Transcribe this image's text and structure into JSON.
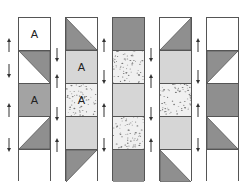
{
  "diagram": {
    "colors": {
      "white": "#ffffff",
      "dark": "#8f8f8f",
      "medium": "#a3a3a3",
      "light": "#d6d6d6",
      "speckled_bg": "#f0f0f0",
      "speckle": "#7a7a7a",
      "border": "#555555"
    },
    "columns": [
      {
        "x": 18,
        "squares": [
          {
            "type": "solid",
            "fill": "white",
            "label": "A"
          },
          {
            "type": "hst",
            "dark": "top-right",
            "light_fill": "white"
          },
          {
            "type": "solid",
            "fill": "medium",
            "label": "A"
          },
          {
            "type": "hst",
            "dark": "bottom-right",
            "light_fill": "white"
          },
          {
            "type": "solid",
            "fill": "white",
            "label": ""
          }
        ],
        "arrows": [
          {
            "y": 38,
            "dir": "up",
            "x": 9
          },
          {
            "y": 64,
            "dir": "down",
            "x": 9
          },
          {
            "y": 103,
            "dir": "up",
            "x": 9
          },
          {
            "y": 138,
            "dir": "down",
            "x": 9
          }
        ]
      },
      {
        "x": 65,
        "squares": [
          {
            "type": "hst",
            "dark": "bottom-left",
            "light_fill": "white"
          },
          {
            "type": "solid",
            "fill": "light",
            "label": "A"
          },
          {
            "type": "speckled",
            "label": "A"
          },
          {
            "type": "solid",
            "fill": "light",
            "label": ""
          },
          {
            "type": "hst",
            "dark": "top-left",
            "light_fill": "white"
          }
        ],
        "arrows": [
          {
            "y": 48,
            "dir": "down",
            "x": 57
          },
          {
            "y": 74,
            "dir": "up",
            "x": 57
          },
          {
            "y": 107,
            "dir": "down",
            "x": 57
          },
          {
            "y": 138,
            "dir": "up",
            "x": 57
          }
        ]
      },
      {
        "x": 112,
        "squares": [
          {
            "type": "solid",
            "fill": "dark",
            "label": ""
          },
          {
            "type": "speckled",
            "label": ""
          },
          {
            "type": "solid",
            "fill": "light",
            "label": ""
          },
          {
            "type": "speckled",
            "label": ""
          },
          {
            "type": "solid",
            "fill": "dark",
            "label": ""
          }
        ],
        "arrows": [
          {
            "y": 38,
            "dir": "up",
            "x": 104
          },
          {
            "y": 70,
            "dir": "down",
            "x": 104
          },
          {
            "y": 103,
            "dir": "up",
            "x": 104
          },
          {
            "y": 138,
            "dir": "down",
            "x": 104
          }
        ]
      },
      {
        "x": 159,
        "squares": [
          {
            "type": "hst",
            "dark": "bottom-right",
            "light_fill": "white"
          },
          {
            "type": "solid",
            "fill": "light",
            "label": ""
          },
          {
            "type": "speckled",
            "label": ""
          },
          {
            "type": "solid",
            "fill": "light",
            "label": ""
          },
          {
            "type": "hst",
            "dark": "bottom-left",
            "light_fill": "white"
          }
        ],
        "arrows": [
          {
            "y": 48,
            "dir": "down",
            "x": 151
          },
          {
            "y": 74,
            "dir": "up",
            "x": 151
          },
          {
            "y": 107,
            "dir": "down",
            "x": 151
          },
          {
            "y": 138,
            "dir": "up",
            "x": 151
          }
        ]
      },
      {
        "x": 206,
        "squares": [
          {
            "type": "solid",
            "fill": "white",
            "label": ""
          },
          {
            "type": "hst",
            "dark": "top-left",
            "light_fill": "white"
          },
          {
            "type": "solid",
            "fill": "dark",
            "label": ""
          },
          {
            "type": "hst",
            "dark": "bottom-left",
            "light_fill": "white"
          },
          {
            "type": "solid",
            "fill": "white",
            "label": ""
          }
        ],
        "arrows": [
          {
            "y": 38,
            "dir": "up",
            "x": 198
          },
          {
            "y": 70,
            "dir": "down",
            "x": 198
          },
          {
            "y": 103,
            "dir": "up",
            "x": 198
          },
          {
            "y": 138,
            "dir": "down",
            "x": 198
          }
        ]
      }
    ]
  }
}
